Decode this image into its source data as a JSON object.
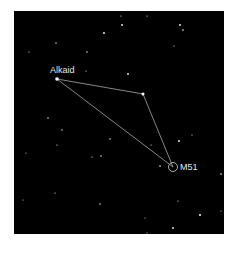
{
  "map": {
    "background": "#000000",
    "line_color": "#bfbfbf",
    "star_color": "#ffffff",
    "labels": {
      "alkaid": "Alkaid",
      "m51": "M51"
    },
    "asterism": {
      "alkaid": {
        "x": 57,
        "y": 79
      },
      "middle_star": {
        "x": 143,
        "y": 94
      },
      "m51": {
        "x": 173,
        "y": 167,
        "r": 4.5
      }
    },
    "background_stars": [
      {
        "x": 104,
        "y": 33,
        "r": 0.9
      },
      {
        "x": 56,
        "y": 43,
        "r": 0.7
      },
      {
        "x": 29,
        "y": 52,
        "r": 0.6
      },
      {
        "x": 87,
        "y": 52,
        "r": 0.7
      },
      {
        "x": 86,
        "y": 71,
        "r": 0.6
      },
      {
        "x": 121,
        "y": 16,
        "r": 0.6
      },
      {
        "x": 122,
        "y": 25,
        "r": 0.9
      },
      {
        "x": 147,
        "y": 16,
        "r": 0.6
      },
      {
        "x": 180,
        "y": 25,
        "r": 0.9
      },
      {
        "x": 183,
        "y": 30,
        "r": 0.8
      },
      {
        "x": 174,
        "y": 46,
        "r": 0.6
      },
      {
        "x": 128,
        "y": 74,
        "r": 0.9
      },
      {
        "x": 179,
        "y": 141,
        "r": 0.9
      },
      {
        "x": 192,
        "y": 135,
        "r": 0.6
      },
      {
        "x": 151,
        "y": 145,
        "r": 0.6
      },
      {
        "x": 48,
        "y": 118,
        "r": 0.7
      },
      {
        "x": 62,
        "y": 130,
        "r": 0.7
      },
      {
        "x": 57,
        "y": 145,
        "r": 0.6
      },
      {
        "x": 110,
        "y": 139,
        "r": 0.7
      },
      {
        "x": 92,
        "y": 157,
        "r": 0.6
      },
      {
        "x": 101,
        "y": 156,
        "r": 0.7
      },
      {
        "x": 26,
        "y": 153,
        "r": 0.5
      },
      {
        "x": 55,
        "y": 193,
        "r": 0.6
      },
      {
        "x": 23,
        "y": 200,
        "r": 0.5
      },
      {
        "x": 100,
        "y": 204,
        "r": 0.7
      },
      {
        "x": 160,
        "y": 166,
        "r": 0.8
      },
      {
        "x": 221,
        "y": 174,
        "r": 0.8
      },
      {
        "x": 178,
        "y": 201,
        "r": 0.6
      },
      {
        "x": 200,
        "y": 215,
        "r": 1.0
      },
      {
        "x": 173,
        "y": 228,
        "r": 0.9
      },
      {
        "x": 145,
        "y": 218,
        "r": 0.5
      },
      {
        "x": 221,
        "y": 211,
        "r": 0.5
      },
      {
        "x": 147,
        "y": 233,
        "r": 0.5
      }
    ]
  }
}
